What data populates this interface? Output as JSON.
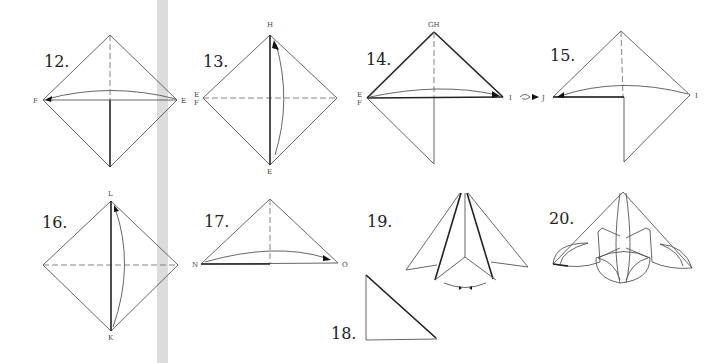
{
  "steps": [
    {
      "number": "12.",
      "points": {
        "left": "F",
        "right": "E"
      }
    },
    {
      "number": "13.",
      "points": {
        "top": "H",
        "left_top": "E",
        "left_bottom": "F",
        "bottom": "E"
      }
    },
    {
      "number": "14.",
      "points": {
        "top": "GH",
        "left_top": "E",
        "left_bottom": "F",
        "right": "I",
        "turn_target": "J"
      }
    },
    {
      "number": "15.",
      "points": {
        "left": "J",
        "right": "I"
      }
    },
    {
      "number": "16.",
      "points": {
        "top": "L",
        "bottom": "K"
      }
    },
    {
      "number": "17.",
      "points": {
        "left": "N",
        "right": "O"
      }
    },
    {
      "number": "18.",
      "points": {}
    },
    {
      "number": "19.",
      "points": {}
    },
    {
      "number": "20.",
      "points": {}
    }
  ],
  "symbols": {
    "turn_over": "turn-over-icon"
  },
  "colors": {
    "line": "#555555",
    "dark_line": "#222222",
    "gutter": "#dcdcdc",
    "background": "#ffffff"
  }
}
